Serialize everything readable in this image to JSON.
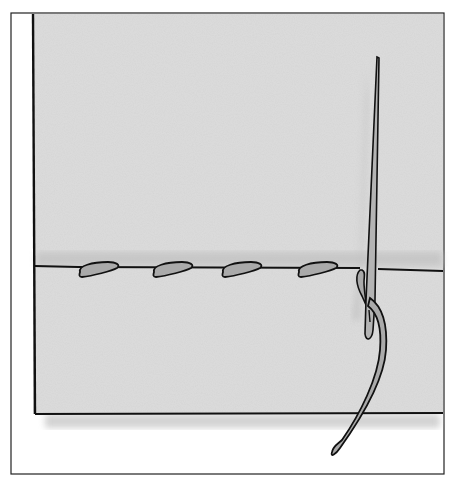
{
  "illustration": {
    "subject": "running stitch sewing illustration",
    "elements": [
      "fabric",
      "seam-line",
      "stitches",
      "needle",
      "thread"
    ],
    "stitch_count": 4
  },
  "colors": {
    "background": "#ffffff",
    "fabric": "#dcdcdc",
    "shadow": "#bdbdbd",
    "thread": "#a8a8a8",
    "ink": "#111111"
  }
}
